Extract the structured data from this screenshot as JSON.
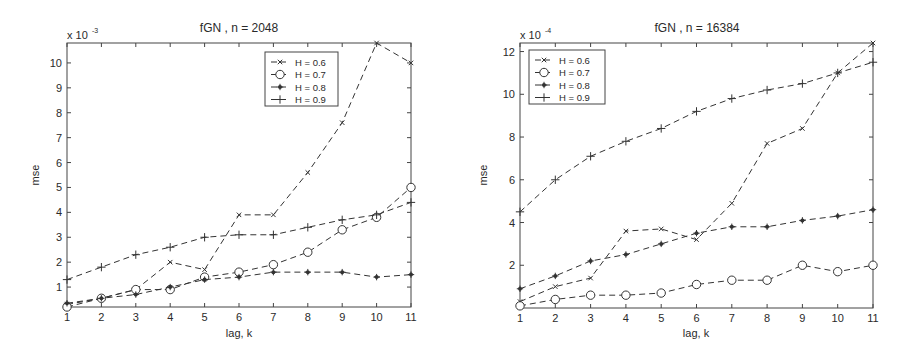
{
  "chart_data": [
    {
      "type": "line",
      "title": "fGN , n = 2048",
      "xlabel": "lag, k",
      "ylabel": "mse",
      "y_scale_label": "x 10",
      "y_scale_exponent": "-3",
      "x": [
        1,
        2,
        3,
        4,
        5,
        6,
        7,
        8,
        9,
        10,
        11
      ],
      "xticks": [
        1,
        2,
        3,
        4,
        5,
        6,
        7,
        8,
        9,
        10,
        11
      ],
      "yticks": [
        1,
        2,
        3,
        4,
        5,
        6,
        7,
        8,
        9,
        10
      ],
      "xlim": [
        1,
        11
      ],
      "ylim": [
        0.2,
        10.8
      ],
      "grid": false,
      "legend_position": "upper-right",
      "series": [
        {
          "name": "H = 0.6",
          "marker": "x",
          "values": [
            0.3,
            0.55,
            0.9,
            2.0,
            1.7,
            3.9,
            3.9,
            5.6,
            7.6,
            10.8,
            10.0
          ]
        },
        {
          "name": "H = 0.7",
          "marker": "o",
          "values": [
            0.2,
            0.55,
            0.9,
            0.9,
            1.4,
            1.6,
            1.9,
            2.4,
            3.3,
            3.8,
            5.0
          ]
        },
        {
          "name": "H = 0.8",
          "marker": "*",
          "values": [
            0.35,
            0.55,
            0.7,
            1.0,
            1.3,
            1.4,
            1.6,
            1.6,
            1.6,
            1.4,
            1.5
          ]
        },
        {
          "name": "H = 0.9",
          "marker": "+",
          "values": [
            1.3,
            1.8,
            2.3,
            2.6,
            3.0,
            3.1,
            3.1,
            3.4,
            3.7,
            3.9,
            4.4
          ]
        }
      ]
    },
    {
      "type": "line",
      "title": "fGN , n = 16384",
      "xlabel": "lag, k",
      "ylabel": "mse",
      "y_scale_label": "x 10",
      "y_scale_exponent": "-4",
      "x": [
        1,
        2,
        3,
        4,
        5,
        6,
        7,
        8,
        9,
        10,
        11
      ],
      "xticks": [
        1,
        2,
        3,
        4,
        5,
        6,
        7,
        8,
        9,
        10,
        11
      ],
      "yticks": [
        2,
        4,
        6,
        8,
        10,
        12
      ],
      "xlim": [
        1,
        11
      ],
      "ylim": [
        0,
        12.4
      ],
      "grid": false,
      "legend_position": "upper-left",
      "series": [
        {
          "name": "H = 0.6",
          "marker": "x",
          "values": [
            0.3,
            1.0,
            1.4,
            3.6,
            3.7,
            3.2,
            4.9,
            7.7,
            8.4,
            11.0,
            12.4
          ]
        },
        {
          "name": "H = 0.7",
          "marker": "o",
          "values": [
            0.1,
            0.4,
            0.6,
            0.6,
            0.7,
            1.1,
            1.3,
            1.3,
            2.0,
            1.7,
            2.0
          ]
        },
        {
          "name": "H = 0.8",
          "marker": "*",
          "values": [
            0.9,
            1.5,
            2.2,
            2.5,
            3.0,
            3.5,
            3.8,
            3.8,
            4.1,
            4.3,
            4.6
          ]
        },
        {
          "name": "H = 0.9",
          "marker": "+",
          "values": [
            4.5,
            6.0,
            7.1,
            7.8,
            8.4,
            9.2,
            9.8,
            10.2,
            10.5,
            11.0,
            11.5
          ]
        }
      ]
    }
  ],
  "colors": {
    "line": "#333333",
    "axis": "#444444",
    "background": "#ffffff"
  }
}
